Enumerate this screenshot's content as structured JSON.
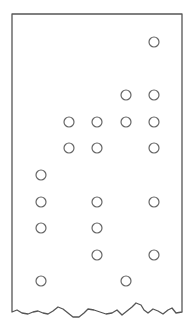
{
  "figure": {
    "type": "punched-card",
    "border_color": "#555555",
    "hole_color": "#666666",
    "columns_x": [
      41,
      69,
      97,
      126,
      154
    ],
    "rows": [
      {
        "y": 42,
        "holes": [
          0,
          0,
          0,
          0,
          1
        ]
      },
      {
        "y": 95,
        "holes": [
          0,
          0,
          0,
          1,
          1
        ]
      },
      {
        "y": 122,
        "holes": [
          0,
          1,
          1,
          1,
          1
        ]
      },
      {
        "y": 148,
        "holes": [
          0,
          1,
          1,
          0,
          1
        ]
      },
      {
        "y": 175,
        "holes": [
          1,
          0,
          0,
          0,
          0
        ]
      },
      {
        "y": 202,
        "holes": [
          1,
          0,
          1,
          0,
          1
        ]
      },
      {
        "y": 228,
        "holes": [
          1,
          0,
          1,
          0,
          0
        ]
      },
      {
        "y": 255,
        "holes": [
          0,
          0,
          1,
          0,
          1
        ]
      },
      {
        "y": 281,
        "holes": [
          1,
          0,
          0,
          1,
          0
        ]
      }
    ]
  }
}
